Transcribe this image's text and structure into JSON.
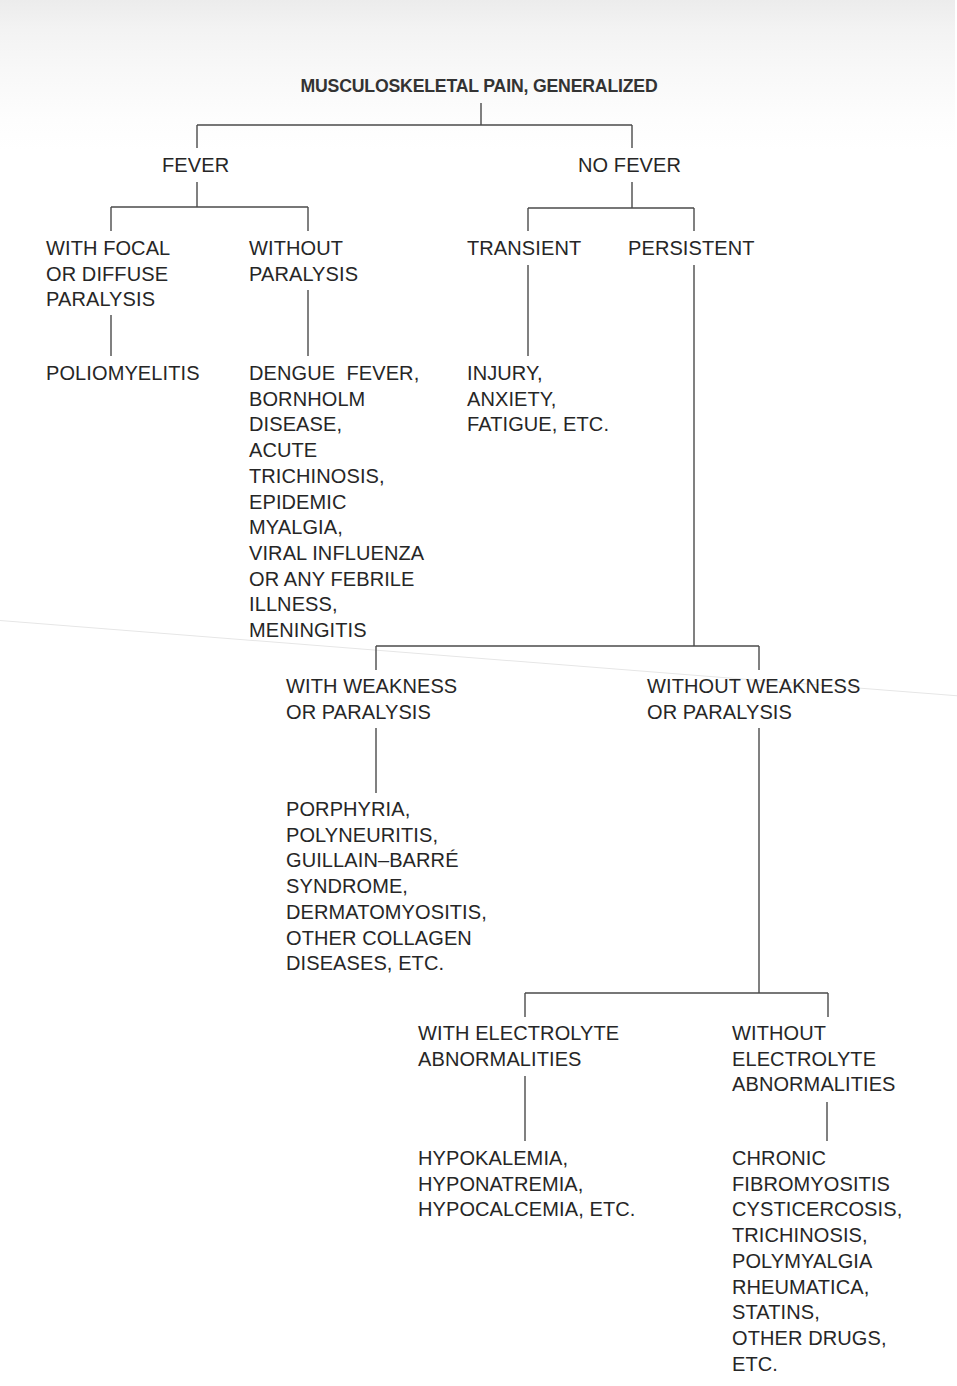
{
  "diagram": {
    "title": "MUSCULOSKELETAL PAIN, GENERALIZED",
    "level1": {
      "fever": "FEVER",
      "no_fever": "NO FEVER"
    },
    "fever_branches": {
      "with_paralysis": "WITH FOCAL\nOR DIFFUSE\nPARALYSIS",
      "without_paralysis": "WITHOUT\nPARALYSIS"
    },
    "fever_outcomes": {
      "with_paralysis": "POLIOMYELITIS",
      "without_paralysis": "DENGUE  FEVER,\nBORNHOLM\nDISEASE,\nACUTE\nTRICHINOSIS,\nEPIDEMIC\nMYALGIA,\nVIRAL INFLUENZA\nOR ANY FEBRILE\nILLNESS,\nMENINGITIS"
    },
    "no_fever_branches": {
      "transient": "TRANSIENT",
      "persistent": "PERSISTENT"
    },
    "transient_outcome": "INJURY,\nANXIETY,\nFATIGUE, ETC.",
    "persistent_branches": {
      "with_weakness": "WITH WEAKNESS\nOR PARALYSIS",
      "without_weakness": "WITHOUT WEAKNESS\nOR PARALYSIS"
    },
    "with_weakness_outcome": "PORPHYRIA,\nPOLYNEURITIS,\nGUILLAIN–BARRÉ\nSYNDROME,\nDERMATOMYOSITIS,\nOTHER COLLAGEN\nDISEASES, ETC.",
    "electrolyte_branches": {
      "with": "WITH ELECTROLYTE\nABNORMALITIES",
      "without": "WITHOUT\nELECTROLYTE\nABNORMALITIES"
    },
    "electrolyte_outcomes": {
      "with": "HYPOKALEMIA,\nHYPONATREMIA,\nHYPOCALCEMIA, ETC.",
      "without": "CHRONIC\nFIBROMYOSITIS\nCYSTICERCOSIS,\nTRICHINOSIS,\nPOLYMYALGIA\nRHEUMATICA,\nSTATINS,\nOTHER DRUGS,\nETC."
    }
  },
  "colors": {
    "text": "#262626",
    "lines": "#4a4a4a",
    "background": "#ffffff"
  }
}
